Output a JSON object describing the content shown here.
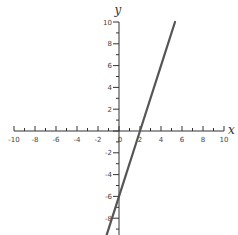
{
  "chart_data": {
    "type": "line",
    "title": "",
    "xlabel": "x",
    "ylabel": "y",
    "xlim": [
      -10,
      10
    ],
    "ylim": [
      -10,
      10
    ],
    "grid": false,
    "x_ticks": [
      -10,
      -8,
      -6,
      -4,
      -2,
      0,
      2,
      4,
      6,
      8,
      10
    ],
    "y_ticks": [
      -8,
      -6,
      -4,
      -2,
      0,
      2,
      4,
      6,
      8,
      10
    ],
    "x_tick_labels": [
      "-10",
      "-8",
      "-6",
      "-4",
      "-2",
      "0",
      "2",
      "4",
      "6",
      "8",
      "10"
    ],
    "y_tick_labels": [
      "-8",
      "-6",
      "-4",
      "-2",
      "0",
      "2",
      "4",
      "6",
      "8",
      "10"
    ],
    "series": [
      {
        "name": "y = 3x - 6",
        "color": "#555555",
        "x": [
          -1.23,
          0,
          2,
          4,
          5.33
        ],
        "y": [
          -9.7,
          -6,
          0,
          6,
          10
        ]
      }
    ]
  },
  "axes": {
    "x_label": "x",
    "y_label": "y",
    "color": "#333333",
    "line_color": "#555555"
  }
}
